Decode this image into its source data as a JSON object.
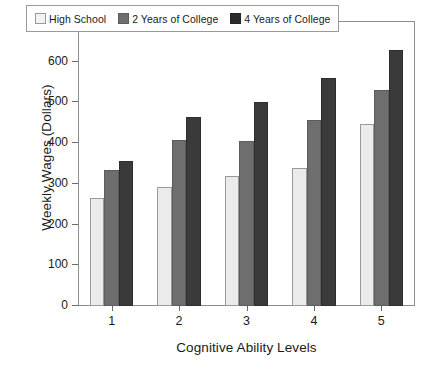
{
  "chart_data": {
    "type": "bar",
    "title": "",
    "subtitle": "",
    "xlabel": "Cognitive Ability Levels",
    "ylabel": "Weekly Wages (Dollars)",
    "categories": [
      "1",
      "2",
      "3",
      "4",
      "5"
    ],
    "series": [
      {
        "name": "High School",
        "color": "#ebebeb",
        "values": [
          265,
          293,
          319,
          338,
          446
        ]
      },
      {
        "name": "2 Years of College",
        "color": "#6e6e6e",
        "values": [
          335,
          408,
          406,
          457,
          530
        ]
      },
      {
        "name": "4 Years of College",
        "color": "#3a3a3a",
        "values": [
          356,
          465,
          502,
          560,
          628
        ]
      }
    ],
    "ylim": [
      0,
      700
    ],
    "ytick_values": [
      0,
      100,
      200,
      300,
      400,
      500,
      600,
      700
    ],
    "ytick_labels": [
      "0",
      "100",
      "200",
      "300",
      "400",
      "500",
      "600",
      "700"
    ],
    "xtick_labels": [
      "1",
      "2",
      "3",
      "4",
      "5"
    ],
    "grid": false,
    "legend_position": "top-center",
    "frame": true
  },
  "legend": {
    "entries": [
      {
        "label": "High School",
        "swatch": "legend-swatch-high-school"
      },
      {
        "label": "2 Years of College",
        "swatch": "legend-swatch-2-years-college"
      },
      {
        "label": "4 Years of College",
        "swatch": "legend-swatch-4-years-college"
      }
    ]
  }
}
